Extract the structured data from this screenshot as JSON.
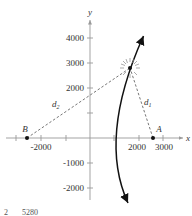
{
  "figure": {
    "axis_labels": {
      "x": "x",
      "y": "y"
    },
    "x_ticks": [
      {
        "value": -3000,
        "label": ""
      },
      {
        "value": -2000,
        "label": "-2000"
      },
      {
        "value": -1000,
        "label": ""
      },
      {
        "value": 1000,
        "label": ""
      },
      {
        "value": 2000,
        "label": "2000"
      },
      {
        "value": 3000,
        "label": "3000"
      }
    ],
    "y_ticks": [
      {
        "value": 4000,
        "label": "4000"
      },
      {
        "value": 3000,
        "label": "3000"
      },
      {
        "value": 2000,
        "label": "2000"
      },
      {
        "value": 1000,
        "label": ""
      },
      {
        "value": -1000,
        "label": "-1000"
      },
      {
        "value": -2000,
        "label": "-2000"
      }
    ],
    "points": {
      "A": {
        "label": "A"
      },
      "B": {
        "label": "B"
      }
    },
    "distances": {
      "d1": {
        "base": "d",
        "sub": "1"
      },
      "d2": {
        "base": "d",
        "sub": "2"
      }
    },
    "footer_cut_text": "2       5280"
  }
}
